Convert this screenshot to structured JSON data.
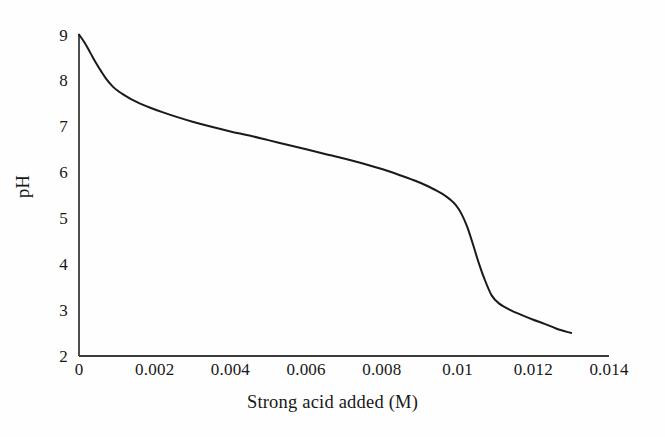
{
  "chart_data": {
    "type": "line",
    "title": "",
    "subtitle": "",
    "xlabel": "Strong acid added (M)",
    "ylabel": "pH",
    "xlim": [
      0,
      0.014
    ],
    "ylim": [
      2,
      9
    ],
    "grid": false,
    "legend": null,
    "legend_position": "none",
    "annotations": [],
    "xticks": [
      "0",
      "0.002",
      "0.004",
      "0.006",
      "0.008",
      "0.01",
      "0.012",
      "0.014"
    ],
    "xtick_values": [
      0,
      0.002,
      0.004,
      0.006,
      0.008,
      0.01,
      0.012,
      0.014
    ],
    "yticks": [
      "9",
      "8",
      "7",
      "6",
      "5",
      "4",
      "3",
      "2"
    ],
    "ytick_values": [
      9,
      8,
      7,
      6,
      5,
      4,
      3,
      2
    ],
    "line_color": "#1a1a1a",
    "line_width": 2.0,
    "axis_color": "#3a3a3a",
    "background_color": "#fefefe",
    "series": [
      {
        "name": "Titration curve",
        "x": [
          0.0,
          0.00015,
          0.0003,
          0.00045,
          0.0006,
          0.00075,
          0.0009,
          0.00105,
          0.0012,
          0.0014,
          0.0016,
          0.0019,
          0.0022,
          0.0026,
          0.003,
          0.0035,
          0.004,
          0.0045,
          0.005,
          0.0055,
          0.006,
          0.0065,
          0.007,
          0.0075,
          0.008,
          0.0085,
          0.0088,
          0.0091,
          0.0094,
          0.0096,
          0.0098,
          0.00995,
          0.0101,
          0.01025,
          0.0104,
          0.01055,
          0.0107,
          0.0109,
          0.0111,
          0.0114,
          0.0117,
          0.012,
          0.0123,
          0.0126,
          0.013
        ],
        "y": [
          9.0,
          8.82,
          8.6,
          8.38,
          8.18,
          8.0,
          7.86,
          7.76,
          7.68,
          7.58,
          7.5,
          7.4,
          7.31,
          7.2,
          7.1,
          6.99,
          6.89,
          6.8,
          6.7,
          6.6,
          6.5,
          6.4,
          6.3,
          6.19,
          6.07,
          5.93,
          5.84,
          5.74,
          5.62,
          5.53,
          5.41,
          5.29,
          5.1,
          4.82,
          4.45,
          4.05,
          3.7,
          3.32,
          3.14,
          3.0,
          2.89,
          2.79,
          2.7,
          2.6,
          2.5
        ]
      }
    ]
  },
  "axes": {
    "x_title": "Strong acid added (M)",
    "y_title": "pH"
  }
}
